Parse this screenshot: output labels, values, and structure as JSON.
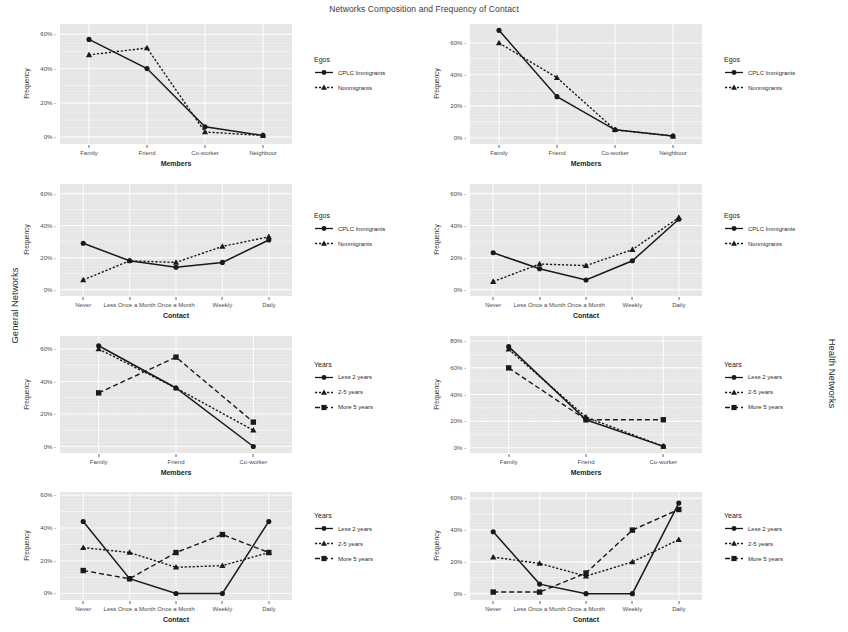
{
  "figure": {
    "title": "Networks Composition and Frequency of Contact",
    "row_label_left": "General Networks",
    "row_label_right": "Health Networks",
    "ylabel": "Frequency",
    "line_color": "#1a1a1a",
    "panel_bg": "#eaeaea",
    "grid_color": "#ffffff"
  },
  "legends": {
    "egos": {
      "title": "Egos",
      "items": [
        {
          "label": "CPLC Immigrants",
          "marker": "circle",
          "style": "solid"
        },
        {
          "label": "Nonmigrants",
          "marker": "triangle",
          "style": "dotted"
        }
      ]
    },
    "years": {
      "title": "Years",
      "items": [
        {
          "label": "Less 2 years",
          "marker": "circle",
          "style": "solid"
        },
        {
          "label": "2-5 years",
          "marker": "triangle",
          "style": "dotted"
        },
        {
          "label": "More 5 years",
          "marker": "square",
          "style": "dashed"
        }
      ]
    }
  },
  "chart_data": [
    {
      "id": "p1",
      "type": "line",
      "title": "",
      "xlabel": "Members",
      "ylabel": "Frequency",
      "categories": [
        "Family",
        "Friend",
        "Co-worker",
        "Neighbour"
      ],
      "yticks": [
        0,
        20,
        40,
        60
      ],
      "yticklabels": [
        "0%",
        "20%",
        "40%",
        "60%"
      ],
      "ylim": [
        -4,
        66
      ],
      "grid": true,
      "legend": "egos",
      "legend_position": "right",
      "series": [
        {
          "name": "CPLC Immigrants",
          "marker": "circle",
          "style": "solid",
          "values": [
            57,
            40,
            6,
            1
          ]
        },
        {
          "name": "Nonmigrants",
          "marker": "triangle",
          "style": "dotted",
          "values": [
            48,
            52,
            3,
            1
          ]
        }
      ]
    },
    {
      "id": "p2",
      "type": "line",
      "title": "",
      "xlabel": "Members",
      "ylabel": "Frequency",
      "categories": [
        "Family",
        "Friend",
        "Co-worker",
        "Neighbour"
      ],
      "yticks": [
        0,
        20,
        40,
        60
      ],
      "yticklabels": [
        "0%",
        "20%",
        "40%",
        "60%"
      ],
      "ylim": [
        -4,
        72
      ],
      "grid": true,
      "legend": "egos",
      "legend_position": "right",
      "series": [
        {
          "name": "CPLC Immigrants",
          "marker": "circle",
          "style": "solid",
          "values": [
            68,
            26,
            5,
            1
          ]
        },
        {
          "name": "Nonmigrants",
          "marker": "triangle",
          "style": "dotted",
          "values": [
            60,
            38,
            5,
            1
          ]
        }
      ]
    },
    {
      "id": "p3",
      "type": "line",
      "title": "",
      "xlabel": "Contact",
      "ylabel": "Frequency",
      "categories": [
        "Never",
        "Less Once a Month",
        "Once a Month",
        "Weekly",
        "Daily"
      ],
      "yticks": [
        0,
        20,
        40,
        60
      ],
      "yticklabels": [
        "0%",
        "20%",
        "40%",
        "60%"
      ],
      "ylim": [
        -4,
        66
      ],
      "grid": true,
      "legend": "egos",
      "legend_position": "right",
      "series": [
        {
          "name": "CPLC Immigrants",
          "marker": "circle",
          "style": "solid",
          "values": [
            29,
            18,
            14,
            17,
            31
          ]
        },
        {
          "name": "Nonmigrants",
          "marker": "triangle",
          "style": "dotted",
          "values": [
            6,
            18,
            17,
            27,
            33
          ]
        }
      ]
    },
    {
      "id": "p4",
      "type": "line",
      "title": "",
      "xlabel": "Contact",
      "ylabel": "Frequency",
      "categories": [
        "Never",
        "Less Once a Month",
        "Once a Month",
        "Weekly",
        "Daily"
      ],
      "yticks": [
        0,
        20,
        40,
        60
      ],
      "yticklabels": [
        "0%",
        "20%",
        "40%",
        "60%"
      ],
      "ylim": [
        -4,
        66
      ],
      "grid": true,
      "legend": "egos",
      "legend_position": "right",
      "series": [
        {
          "name": "CPLC Immigrants",
          "marker": "circle",
          "style": "solid",
          "values": [
            23,
            13,
            6,
            18,
            44
          ]
        },
        {
          "name": "Nonmigrants",
          "marker": "triangle",
          "style": "dotted",
          "values": [
            5,
            16,
            15,
            25,
            45
          ]
        }
      ]
    },
    {
      "id": "p5",
      "type": "line",
      "title": "",
      "xlabel": "Members",
      "ylabel": "Frequency",
      "categories": [
        "Family",
        "Friend",
        "Co-worker"
      ],
      "yticks": [
        0,
        20,
        40,
        60
      ],
      "yticklabels": [
        "0%",
        "20%",
        "40%",
        "60%"
      ],
      "ylim": [
        -4,
        68
      ],
      "grid": true,
      "legend": "years",
      "legend_position": "right",
      "series": [
        {
          "name": "Less 2 years",
          "marker": "circle",
          "style": "solid",
          "values": [
            62,
            36,
            0
          ]
        },
        {
          "name": "2-5 years",
          "marker": "triangle",
          "style": "dotted",
          "values": [
            60,
            36,
            10
          ]
        },
        {
          "name": "More 5 years",
          "marker": "square",
          "style": "dashed",
          "values": [
            33,
            55,
            15
          ]
        }
      ]
    },
    {
      "id": "p6",
      "type": "line",
      "title": "",
      "xlabel": "Members",
      "ylabel": "Frequency",
      "categories": [
        "Family",
        "Friend",
        "Co-worker"
      ],
      "yticks": [
        0,
        20,
        40,
        60,
        80
      ],
      "yticklabels": [
        "0%",
        "20%",
        "40%",
        "60%",
        "80%"
      ],
      "ylim": [
        -4,
        84
      ],
      "grid": true,
      "legend": "years",
      "legend_position": "right",
      "series": [
        {
          "name": "Less 2 years",
          "marker": "circle",
          "style": "solid",
          "values": [
            76,
            21,
            1
          ]
        },
        {
          "name": "2-5 years",
          "marker": "triangle",
          "style": "dotted",
          "values": [
            74,
            23,
            1
          ]
        },
        {
          "name": "More 5 years",
          "marker": "square",
          "style": "dashed",
          "values": [
            60,
            21,
            21
          ]
        }
      ]
    },
    {
      "id": "p7",
      "type": "line",
      "title": "",
      "xlabel": "Contact",
      "ylabel": "Frequency",
      "categories": [
        "Never",
        "Less Once a Month",
        "Once a Month",
        "Weekly",
        "Daily"
      ],
      "yticks": [
        0,
        20,
        40,
        60
      ],
      "yticklabels": [
        "0%",
        "20%",
        "40%",
        "60%"
      ],
      "ylim": [
        -4,
        62
      ],
      "grid": true,
      "legend": "years",
      "legend_position": "right",
      "series": [
        {
          "name": "Less 2 years",
          "marker": "circle",
          "style": "solid",
          "values": [
            44,
            9,
            0,
            0,
            44
          ]
        },
        {
          "name": "2-5 years",
          "marker": "triangle",
          "style": "dotted",
          "values": [
            28,
            25,
            16,
            17,
            25
          ]
        },
        {
          "name": "More 5 years",
          "marker": "square",
          "style": "dashed",
          "values": [
            14,
            9,
            25,
            36,
            25
          ]
        }
      ]
    },
    {
      "id": "p8",
      "type": "line",
      "title": "",
      "xlabel": "Contact",
      "ylabel": "Frequency",
      "categories": [
        "Never",
        "Less Once a Month",
        "Once a Month",
        "Weekly",
        "Daily"
      ],
      "yticks": [
        0,
        20,
        40,
        60
      ],
      "yticklabels": [
        "0%",
        "20%",
        "40%",
        "60%"
      ],
      "ylim": [
        -4,
        64
      ],
      "grid": true,
      "legend": "years",
      "legend_position": "right",
      "series": [
        {
          "name": "Less 2 years",
          "marker": "circle",
          "style": "solid",
          "values": [
            39,
            6,
            0,
            0,
            57
          ]
        },
        {
          "name": "2-5 years",
          "marker": "triangle",
          "style": "dotted",
          "values": [
            23,
            19,
            11,
            20,
            34
          ]
        },
        {
          "name": "More 5 years",
          "marker": "square",
          "style": "dashed",
          "values": [
            1,
            1,
            13,
            40,
            53
          ]
        }
      ]
    }
  ]
}
